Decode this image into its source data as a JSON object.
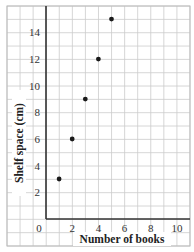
{
  "chart_data": {
    "type": "scatter",
    "title": "",
    "xlabel": "Number of books",
    "ylabel": "Shelf space (cm)",
    "x": [
      1,
      2,
      3,
      4,
      5
    ],
    "y": [
      3,
      6,
      9,
      12,
      15
    ],
    "series": [
      {
        "name": "Shelf space",
        "points": [
          [
            1,
            3
          ],
          [
            2,
            6
          ],
          [
            3,
            9
          ],
          [
            4,
            12
          ],
          [
            5,
            15
          ]
        ]
      }
    ],
    "xticks": [
      0,
      2,
      4,
      6,
      8,
      10
    ],
    "yticks": [
      2,
      4,
      6,
      8,
      10,
      12,
      14
    ],
    "xlim": [
      0,
      10
    ],
    "ylim": [
      0,
      16
    ],
    "grid": true,
    "legend": "none",
    "colors": {
      "point": "#1a1a1a",
      "grid": "#cccccc",
      "axis": "#333333"
    }
  }
}
